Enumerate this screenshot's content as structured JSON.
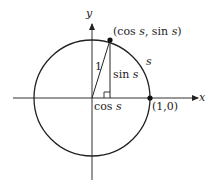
{
  "diagram": {
    "axes": {
      "x_label": "x",
      "y_label": "y"
    },
    "point_on_circle": {
      "label_open": "(cos ",
      "s1": "s",
      "mid": ", sin ",
      "s2": "s",
      "close": ")"
    },
    "radius_label": "1",
    "arc_label": "s",
    "sin_label": "sin ",
    "sin_var": "s",
    "cos_label": "cos ",
    "cos_var": "s",
    "unit_point_label": "(1,0)",
    "colors": {
      "line": "#222222",
      "background": "#ffffff"
    }
  }
}
